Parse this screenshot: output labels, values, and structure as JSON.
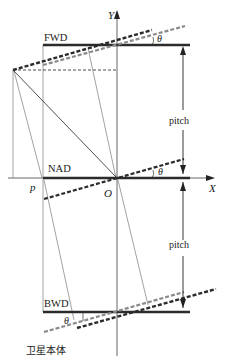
{
  "diagram": {
    "type": "satellite-stereo-imaging-geometry",
    "axes": {
      "x_label": "X",
      "y_label": "Y",
      "origin_label": "O"
    },
    "views": [
      {
        "id": "fwd",
        "label": "FWD"
      },
      {
        "id": "nad",
        "label": "NAD"
      },
      {
        "id": "bwd",
        "label": "BWD"
      }
    ],
    "angle_label": "θ",
    "point_label": "p",
    "pitch_labels": [
      "pitch",
      "pitch"
    ],
    "body_label": "卫星本体",
    "colors": {
      "solid_line": "#2b2b2b",
      "dashed_dark": "#2b2b2b",
      "dashed_gray": "#8a8a8a",
      "thin_line": "#8a8a8a",
      "axis": "#555555"
    }
  }
}
